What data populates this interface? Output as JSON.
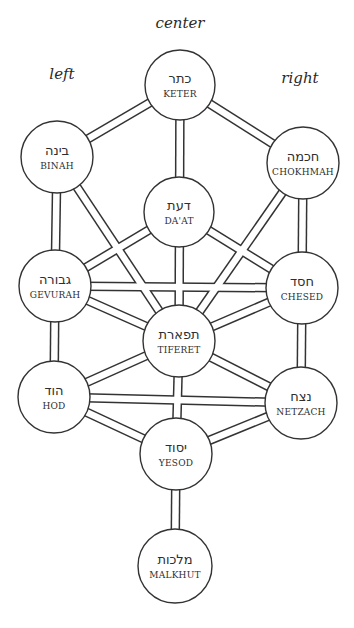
{
  "diagram": {
    "column_labels": [
      {
        "id": "center",
        "text": "center",
        "x": 180,
        "y": 14
      },
      {
        "id": "left",
        "text": "left",
        "x": 62,
        "y": 65
      },
      {
        "id": "right",
        "text": "right",
        "x": 300,
        "y": 69
      }
    ],
    "colors": {
      "stroke": "#333333",
      "fill": "#ffffff",
      "text": "#2e2e2e"
    },
    "nodes": [
      {
        "id": "keter",
        "hebrew": "כתר",
        "latin": "KETER",
        "x": 180,
        "y": 85,
        "r": 35
      },
      {
        "id": "binah",
        "hebrew": "בינה",
        "latin": "BINAH",
        "x": 57,
        "y": 157,
        "r": 36
      },
      {
        "id": "chokhmah",
        "hebrew": "חכמה",
        "latin": "CHOKHMAH",
        "x": 303,
        "y": 163,
        "r": 36
      },
      {
        "id": "daat",
        "hebrew": "דעת",
        "latin": "DA'AT",
        "x": 179,
        "y": 212,
        "r": 35
      },
      {
        "id": "gevurah",
        "hebrew": "גבורה",
        "latin": "GEVURAH",
        "x": 55,
        "y": 286,
        "r": 36
      },
      {
        "id": "chesed",
        "hebrew": "חסד",
        "latin": "CHESED",
        "x": 302,
        "y": 288,
        "r": 36
      },
      {
        "id": "tiferet",
        "hebrew": "תפארת",
        "latin": "TIFERET",
        "x": 179,
        "y": 341,
        "r": 36
      },
      {
        "id": "hod",
        "hebrew": "הוד",
        "latin": "HOD",
        "x": 54,
        "y": 397,
        "r": 36
      },
      {
        "id": "netzach",
        "hebrew": "נצח",
        "latin": "NETZACH",
        "x": 301,
        "y": 403,
        "r": 36
      },
      {
        "id": "yesod",
        "hebrew": "יסוד",
        "latin": "YESOD",
        "x": 176,
        "y": 454,
        "r": 36
      },
      {
        "id": "malkhut",
        "hebrew": "מלכות",
        "latin": "MALKHUT",
        "x": 175,
        "y": 566,
        "r": 37
      }
    ],
    "paths": [
      [
        "keter",
        "binah"
      ],
      [
        "keter",
        "chokhmah"
      ],
      [
        "keter",
        "tiferet"
      ],
      [
        "binah",
        "gevurah"
      ],
      [
        "binah",
        "tiferet"
      ],
      [
        "chokhmah",
        "chesed"
      ],
      [
        "chokhmah",
        "tiferet"
      ],
      [
        "daat",
        "gevurah"
      ],
      [
        "daat",
        "chesed"
      ],
      [
        "gevurah",
        "chesed"
      ],
      [
        "gevurah",
        "tiferet"
      ],
      [
        "chesed",
        "tiferet"
      ],
      [
        "gevurah",
        "hod"
      ],
      [
        "chesed",
        "netzach"
      ],
      [
        "tiferet",
        "hod"
      ],
      [
        "tiferet",
        "netzach"
      ],
      [
        "tiferet",
        "yesod"
      ],
      [
        "hod",
        "netzach"
      ],
      [
        "hod",
        "yesod"
      ],
      [
        "netzach",
        "yesod"
      ],
      [
        "yesod",
        "malkhut"
      ]
    ]
  }
}
